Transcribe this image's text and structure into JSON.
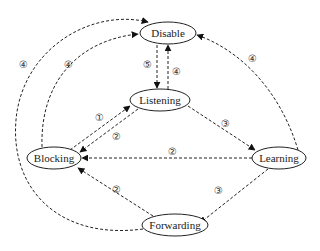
{
  "diagram": {
    "type": "state-transition",
    "nodes": [
      {
        "id": "disable",
        "label": "Disable",
        "cx": 168,
        "cy": 33,
        "rx": 28,
        "ry": 11
      },
      {
        "id": "listening",
        "label": "Listening",
        "cx": 160,
        "cy": 100,
        "rx": 30,
        "ry": 11
      },
      {
        "id": "blocking",
        "label": "Blocking",
        "cx": 52,
        "cy": 158,
        "rx": 28,
        "ry": 11
      },
      {
        "id": "learning",
        "label": "Learning",
        "cx": 280,
        "cy": 158,
        "rx": 28,
        "ry": 11
      },
      {
        "id": "forwarding",
        "label": "Forwarding",
        "cx": 175,
        "cy": 225,
        "rx": 33,
        "ry": 11
      }
    ],
    "edges": [
      {
        "from": "disable",
        "to": "listening",
        "label": "⑤"
      },
      {
        "from": "listening",
        "to": "disable",
        "label": "④"
      },
      {
        "from": "blocking",
        "to": "listening",
        "label": "①"
      },
      {
        "from": "listening",
        "to": "blocking",
        "label": "②"
      },
      {
        "from": "listening",
        "to": "learning",
        "label": "③"
      },
      {
        "from": "learning",
        "to": "blocking",
        "label": "②"
      },
      {
        "from": "learning",
        "to": "forwarding",
        "label": "③"
      },
      {
        "from": "forwarding",
        "to": "blocking",
        "label": "②"
      },
      {
        "from": "blocking",
        "to": "disable",
        "label": "④"
      },
      {
        "from": "forwarding",
        "to": "disable",
        "label": "④"
      },
      {
        "from": "learning",
        "to": "disable",
        "label": "④"
      }
    ]
  }
}
